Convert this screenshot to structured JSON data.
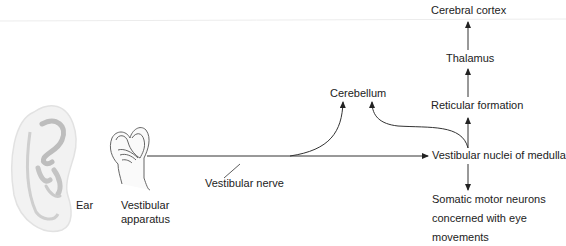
{
  "diagram": {
    "type": "flow",
    "nodes": {
      "ear": "Ear",
      "vestibular_apparatus_line1": "Vestibular",
      "vestibular_apparatus_line2": "apparatus",
      "vestibular_nerve": "Vestibular nerve",
      "cerebellum": "Cerebellum",
      "vestibular_nuclei": "Vestibular nuclei of medulla",
      "reticular_formation": "Reticular formation",
      "thalamus": "Thalamus",
      "cerebral_cortex": "Cerebral cortex",
      "somatic_motor_line1": "Somatic motor neurons",
      "somatic_motor_line2": "concerned with eye",
      "somatic_motor_line3": "movements"
    },
    "edges": [
      {
        "from": "Vestibular apparatus",
        "to": "Vestibular nuclei of medulla",
        "via": "Vestibular nerve"
      },
      {
        "from": "Vestibular nerve",
        "to": "Cerebellum"
      },
      {
        "from": "Vestibular nuclei of medulla",
        "to": "Cerebellum"
      },
      {
        "from": "Vestibular nuclei of medulla",
        "to": "Reticular formation"
      },
      {
        "from": "Reticular formation",
        "to": "Thalamus"
      },
      {
        "from": "Thalamus",
        "to": "Cerebral cortex"
      },
      {
        "from": "Vestibular nuclei of medulla",
        "to": "Somatic motor neurons concerned with eye movements"
      }
    ]
  }
}
